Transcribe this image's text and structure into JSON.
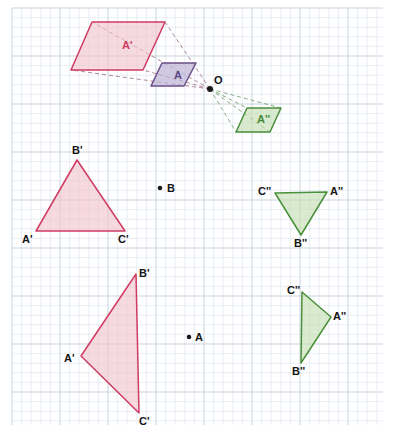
{
  "figure": {
    "width": 397,
    "height": 438,
    "background": "#ffffff",
    "grid": {
      "minor_spacing": 9.6,
      "major_every": 5,
      "minor_color": "#d9e2ec",
      "major_color": "#c3ced8",
      "left": 12,
      "top": 8,
      "right": 383,
      "bottom": 425
    },
    "colors": {
      "red_stroke": "#cf3b62",
      "red_fill": "#f2c3cd",
      "purple_stroke": "#6b4f8a",
      "purple_fill": "#bdb4d6",
      "green_stroke": "#4a8f3c",
      "green_fill": "#c3ddb0",
      "ray_red": "#9a6b7c",
      "ray_green": "#6d9a64",
      "point_black": "#1a1a1a"
    }
  },
  "panels": [
    {
      "id": "panel-top",
      "name": "parallelogram-dilation-about-o",
      "center_of_dilation": {
        "label": "O",
        "x": 210,
        "y": 89
      },
      "shapes": [
        {
          "id": "parallelogram-a-prime",
          "label": "A'",
          "color": "red",
          "label_x": 122,
          "label_y": 40,
          "points": "92,22 165,22 143,70 71,70"
        },
        {
          "id": "parallelogram-a",
          "label": "A",
          "color": "purple",
          "label_x": 174,
          "label_y": 70,
          "points": "162,63 196,63 184,86 151,86"
        },
        {
          "id": "parallelogram-a-double-prime",
          "label": "A''",
          "color": "green",
          "label_x": 257,
          "label_y": 114,
          "points": "247,108 281,108 270,132 236,132"
        }
      ],
      "rays": [
        {
          "id": "ray-o-to-a-prime-tl",
          "color": "red",
          "d": "M 210,89 L 92,22"
        },
        {
          "id": "ray-o-to-a-prime-tr",
          "color": "red",
          "d": "M 210,89 L 165,22"
        },
        {
          "id": "ray-o-to-a-prime-br",
          "color": "red",
          "d": "M 210,89 L 143,70"
        },
        {
          "id": "ray-o-to-a-prime-bl",
          "color": "red",
          "d": "M 210,89 L 71,70"
        },
        {
          "id": "ray-o-to-a-double-prime-tl",
          "color": "green",
          "d": "M 210,89 L 247,108"
        },
        {
          "id": "ray-o-to-a-double-prime-tr",
          "color": "green",
          "d": "M 210,89 L 281,108"
        },
        {
          "id": "ray-o-to-a-double-prime-br",
          "color": "green",
          "d": "M 210,89 L 270,132"
        },
        {
          "id": "ray-o-to-a-double-prime-bl",
          "color": "green",
          "d": "M 210,89 L 236,132"
        }
      ]
    },
    {
      "id": "panel-middle",
      "name": "triangle-dilation-about-b",
      "center_point": {
        "label": "B",
        "x": 160,
        "y": 188,
        "label_x": 167,
        "label_y": 183
      },
      "shapes": [
        {
          "id": "triangle-a-prime-middle",
          "color": "red",
          "points": "36,231 77,160 125,231",
          "vertex_labels": [
            {
              "text": "A'",
              "x": 22,
              "y": 234
            },
            {
              "text": "B'",
              "x": 72,
              "y": 145
            },
            {
              "text": "C'",
              "x": 118,
              "y": 234
            }
          ]
        },
        {
          "id": "triangle-a-double-prime-middle",
          "color": "green",
          "points": "327,192 301,235 275,193",
          "vertex_labels": [
            {
              "text": "A''",
              "x": 330,
              "y": 186
            },
            {
              "text": "B''",
              "x": 294,
              "y": 238
            },
            {
              "text": "C''",
              "x": 258,
              "y": 186
            }
          ]
        }
      ]
    },
    {
      "id": "panel-bottom",
      "name": "triangle-dilation-about-a",
      "center_point": {
        "label": "A",
        "x": 189,
        "y": 337,
        "label_x": 195,
        "label_y": 332
      },
      "shapes": [
        {
          "id": "triangle-a-prime-bottom",
          "color": "red",
          "points": "81,356 136,274 139,413",
          "vertex_labels": [
            {
              "text": "A'",
              "x": 64,
              "y": 353
            },
            {
              "text": "B'",
              "x": 139,
              "y": 268
            },
            {
              "text": "C'",
              "x": 139,
              "y": 416
            }
          ]
        },
        {
          "id": "triangle-a-double-prime-bottom",
          "color": "green",
          "points": "331,317 301,363 302,292",
          "vertex_labels": [
            {
              "text": "A''",
              "x": 333,
              "y": 311
            },
            {
              "text": "B''",
              "x": 292,
              "y": 366
            },
            {
              "text": "C''",
              "x": 287,
              "y": 285
            }
          ]
        }
      ]
    }
  ]
}
